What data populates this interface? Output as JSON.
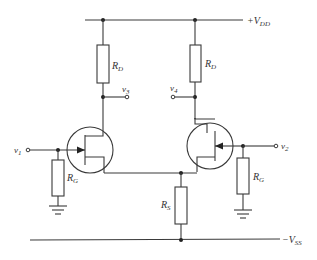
{
  "diagram": {
    "type": "differential JFET amplifier schematic",
    "supplies": {
      "positive": {
        "label": "+V",
        "sub": "DD"
      },
      "negative": {
        "label": "−V",
        "sub": "SS"
      }
    },
    "resistors": {
      "rd_left": {
        "label": "R",
        "sub": "D"
      },
      "rd_right": {
        "label": "R",
        "sub": "D"
      },
      "rg_left": {
        "label": "R",
        "sub": "G"
      },
      "rg_right": {
        "label": "R",
        "sub": "G"
      },
      "rs": {
        "label": "R",
        "sub": "S"
      }
    },
    "nodes": {
      "v1": {
        "label": "v",
        "sub": "1"
      },
      "v2": {
        "label": "v",
        "sub": "2"
      },
      "v3": {
        "label": "v",
        "sub": "3"
      },
      "v4": {
        "label": "v",
        "sub": "4"
      }
    },
    "transistors": [
      {
        "name": "Q1",
        "kind": "n-channel JFET"
      },
      {
        "name": "Q2",
        "kind": "n-channel JFET"
      }
    ],
    "colors": {
      "line": "#3a3a3a",
      "background": "#ffffff"
    }
  }
}
